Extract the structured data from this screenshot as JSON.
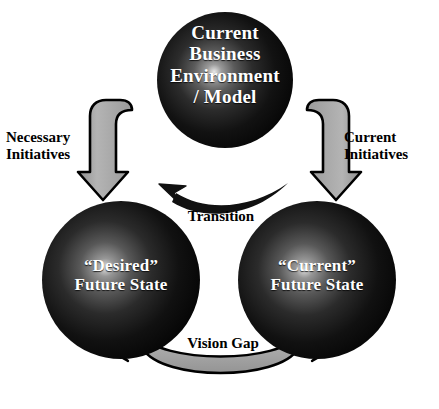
{
  "diagram": {
    "colors": {
      "sphere_dark": "#0d0d0d",
      "sphere_mid": "#4a4a4a",
      "sphere_highlight": "#d9d9d9",
      "arrow_gray_fill": "#a8a8a8",
      "arrow_outline": "#000000",
      "arrow_black": "#111111",
      "text_light": "#ffffff",
      "text_dark": "#000000",
      "background": "#ffffff"
    },
    "nodes": [
      {
        "id": "top-sphere",
        "label": "Current\nBusiness\nEnvironment\n/ Model",
        "shape": "sphere",
        "position": "top-center"
      },
      {
        "id": "left-sphere",
        "label": "“Desired”\nFuture State",
        "shape": "sphere",
        "position": "bottom-left"
      },
      {
        "id": "right-sphere",
        "label": "“Current”\nFuture State",
        "shape": "sphere",
        "position": "bottom-right"
      }
    ],
    "connectors": [
      {
        "id": "necessary-initiatives-arrow",
        "label": "Necessary\nInitiatives",
        "style": "gray-hook-arrow",
        "from": "top-sphere",
        "to": "left-sphere",
        "direction": "down"
      },
      {
        "id": "current-initiatives-arrow",
        "label": "Current\nInitiatives",
        "style": "gray-hook-arrow",
        "from": "top-sphere",
        "to": "right-sphere",
        "direction": "down"
      },
      {
        "id": "transition-arrow",
        "label": "Transition",
        "style": "black-curved-arrow",
        "from": "right-sphere",
        "to": "left-sphere",
        "direction": "right-to-left"
      },
      {
        "id": "vision-gap-arrow",
        "label": "Vision Gap",
        "style": "gray-double-headed-arc",
        "from": "left-sphere",
        "to": "right-sphere",
        "direction": "bidirectional"
      }
    ]
  }
}
